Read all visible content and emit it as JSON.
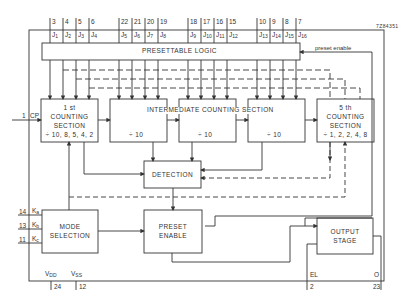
{
  "figure_id": "7Z84351",
  "blocks": {
    "presettable_logic": "PRESETTABLE LOGIC",
    "first_section": [
      "1 st",
      "COUNTING",
      "SECTION",
      "÷ 10, 8, 5, 4, 2"
    ],
    "intermediate_title": "INTERMEDIATE COUNTING SECTION",
    "intermediate_div": [
      "÷ 10",
      "÷ 10",
      "÷ 10"
    ],
    "fifth_section": [
      "5 th",
      "COUNTING",
      "SECTION",
      "÷ 1, 2, 2, 4, 8"
    ],
    "detection": "DETECTION",
    "mode_selection": [
      "MODE",
      "SELECTION"
    ],
    "preset_enable": [
      "PRESET",
      "ENABLE"
    ],
    "output_stage": [
      "OUTPUT",
      "STAGE"
    ]
  },
  "signals": {
    "preset_enable": "preset enable",
    "cp_pin": "1",
    "cp": "CP",
    "ka_pin": "14",
    "ka": "K",
    "ka_sub": "a",
    "kb_pin": "13",
    "kb": "K",
    "kb_sub": "b",
    "kc_pin": "11",
    "kc": "K",
    "kc_sub": "c",
    "vdd": "V",
    "vdd_sub": "DD",
    "vdd_pin": "24",
    "vss": "V",
    "vss_sub": "SS",
    "vss_pin": "12",
    "el": "EL",
    "el_pin": "2",
    "o": "O",
    "o_pin": "23"
  },
  "j_inputs": [
    {
      "pin": "3",
      "name": "J",
      "sub": "1"
    },
    {
      "pin": "4",
      "name": "J",
      "sub": "2"
    },
    {
      "pin": "5",
      "name": "J",
      "sub": "3"
    },
    {
      "pin": "6",
      "name": "J",
      "sub": "4"
    },
    {
      "pin": "22",
      "name": "J",
      "sub": "5"
    },
    {
      "pin": "21",
      "name": "J",
      "sub": "6"
    },
    {
      "pin": "20",
      "name": "J",
      "sub": "7"
    },
    {
      "pin": "19",
      "name": "J",
      "sub": "8"
    },
    {
      "pin": "18",
      "name": "J",
      "sub": "9"
    },
    {
      "pin": "17",
      "name": "J",
      "sub": "10"
    },
    {
      "pin": "16",
      "name": "J",
      "sub": "11"
    },
    {
      "pin": "15",
      "name": "J",
      "sub": "12"
    },
    {
      "pin": "10",
      "name": "J",
      "sub": "13"
    },
    {
      "pin": "9",
      "name": "J",
      "sub": "14"
    },
    {
      "pin": "8",
      "name": "J",
      "sub": "15"
    },
    {
      "pin": "7",
      "name": "J",
      "sub": "16"
    }
  ]
}
